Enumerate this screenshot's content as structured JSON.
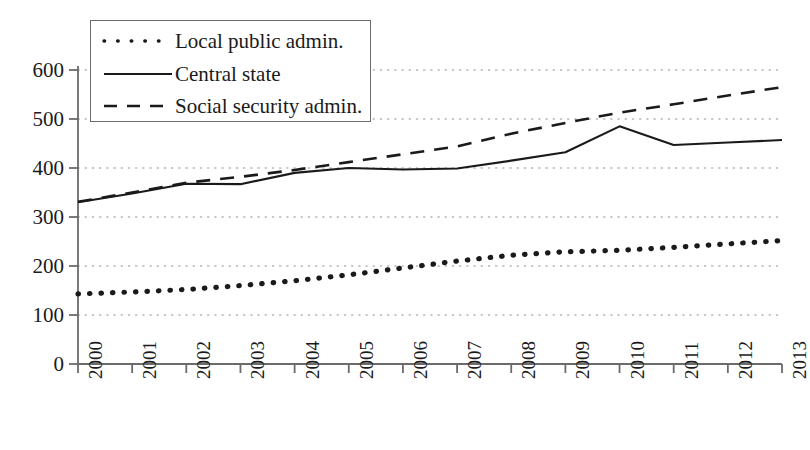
{
  "chart_data": {
    "type": "line",
    "title": "",
    "xlabel": "",
    "ylabel": "",
    "x": [
      2000,
      2001,
      2002,
      2003,
      2004,
      2005,
      2006,
      2007,
      2008,
      2009,
      2010,
      2011,
      2012,
      2013
    ],
    "categories": [
      "2000",
      "2001",
      "2002",
      "2003",
      "2004",
      "2005",
      "2006",
      "2007",
      "2008",
      "2009",
      "2010",
      "2011",
      "2012",
      "2013"
    ],
    "xlim": [
      2000,
      2013
    ],
    "ylim": [
      0,
      600
    ],
    "yticks": [
      0,
      100,
      200,
      300,
      400,
      500,
      600
    ],
    "ytick_labels": [
      "0",
      "100",
      "200",
      "300",
      "400",
      "500",
      "600"
    ],
    "grid": "horizontal-dotted",
    "legend_position": "top-left",
    "series": [
      {
        "name": "Local public admin.",
        "style": "dotted",
        "color": "#1a1a1a",
        "values": [
          143,
          147,
          152,
          160,
          170,
          182,
          196,
          210,
          222,
          229,
          232,
          238,
          245,
          252
        ]
      },
      {
        "name": "Central state",
        "style": "solid",
        "color": "#1a1a1a",
        "values": [
          330,
          348,
          368,
          367,
          390,
          400,
          397,
          399,
          415,
          432,
          485,
          447,
          452,
          457
        ]
      },
      {
        "name": "Social security admin.",
        "style": "dashed",
        "color": "#1a1a1a",
        "values": [
          331,
          350,
          370,
          382,
          396,
          412,
          428,
          444,
          470,
          492,
          513,
          530,
          548,
          565
        ]
      }
    ]
  },
  "legend": {
    "items": [
      {
        "label": "Local public admin.",
        "style": "dotted"
      },
      {
        "label": "Central state",
        "style": "solid"
      },
      {
        "label": "Social security admin.",
        "style": "dashed"
      }
    ]
  },
  "colors": {
    "line": "#1a1a1a",
    "axis": "#6b6b6b",
    "grid": "#b5b5b5",
    "background": "#ffffff"
  }
}
